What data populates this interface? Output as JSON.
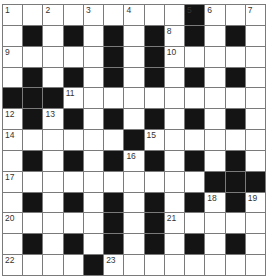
{
  "header": {
    "cut_off_text": ""
  },
  "puzzle": {
    "type": "crossword",
    "rows": 13,
    "cols": 13,
    "colors": {
      "black_cell": "#141414",
      "white_cell": "#ffffff",
      "grid_line": "#7a7a7a",
      "number": "#333333"
    },
    "layout": [
      ".........#...",
      ".#.#.#.#.#.#.",
      ".....#.#.....",
      ".#.#.#.#.#.#.",
      "###..........",
      ".#.#.#.#.#.#.",
      "......#......",
      ".#.#.#.#.#.#.",
      "..........###",
      ".#.#.#.#.#.#.",
      ".....#.#.....",
      ".#.#.#.#.#.#.",
      "....#........"
    ],
    "numbers": [
      {
        "r": 0,
        "c": 0,
        "n": "1"
      },
      {
        "r": 0,
        "c": 2,
        "n": "2"
      },
      {
        "r": 0,
        "c": 4,
        "n": "3"
      },
      {
        "r": 0,
        "c": 6,
        "n": "4"
      },
      {
        "r": 0,
        "c": 9,
        "n": "5"
      },
      {
        "r": 0,
        "c": 10,
        "n": "6"
      },
      {
        "r": 0,
        "c": 12,
        "n": "7"
      },
      {
        "r": 1,
        "c": 8,
        "n": "8"
      },
      {
        "r": 2,
        "c": 0,
        "n": "9"
      },
      {
        "r": 2,
        "c": 8,
        "n": "10"
      },
      {
        "r": 4,
        "c": 3,
        "n": "11"
      },
      {
        "r": 5,
        "c": 0,
        "n": "12"
      },
      {
        "r": 5,
        "c": 2,
        "n": "13"
      },
      {
        "r": 6,
        "c": 0,
        "n": "14"
      },
      {
        "r": 6,
        "c": 7,
        "n": "15"
      },
      {
        "r": 7,
        "c": 6,
        "n": "16"
      },
      {
        "r": 8,
        "c": 0,
        "n": "17"
      },
      {
        "r": 9,
        "c": 10,
        "n": "18"
      },
      {
        "r": 9,
        "c": 12,
        "n": "19"
      },
      {
        "r": 10,
        "c": 0,
        "n": "20"
      },
      {
        "r": 10,
        "c": 8,
        "n": "21"
      },
      {
        "r": 12,
        "c": 0,
        "n": "22"
      },
      {
        "r": 12,
        "c": 5,
        "n": "23"
      }
    ]
  }
}
